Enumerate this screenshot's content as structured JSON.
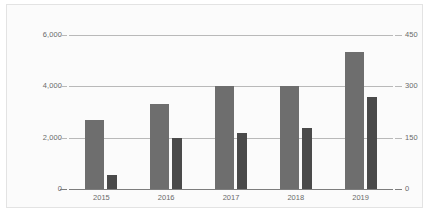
{
  "chart_data": {
    "type": "bar",
    "title": "",
    "subtitle": "",
    "xlabel": "",
    "ylabel": "",
    "categories": [
      "2015",
      "2016",
      "2017",
      "2018",
      "2019"
    ],
    "series": [
      {
        "name": "series-1",
        "axis": "left",
        "color": "#6e6e6e",
        "values": [
          2680,
          3300,
          4020,
          4020,
          5350
        ]
      },
      {
        "name": "series-2",
        "axis": "right",
        "color": "#4a4a4a",
        "values": [
          42,
          150,
          163,
          178,
          268
        ]
      }
    ],
    "left_axis": {
      "ticks": [
        "0",
        "2,000",
        "4,000",
        "6,000"
      ],
      "values": [
        0,
        2000,
        4000,
        6000
      ],
      "ylim": [
        0,
        6000
      ]
    },
    "right_axis": {
      "ticks": [
        "0",
        "150",
        "300",
        "450"
      ],
      "values": [
        0,
        150,
        300,
        450
      ],
      "ylim": [
        0,
        450
      ]
    },
    "grid": true,
    "legend": "none",
    "background_color": "#fbfbfb",
    "border_color": "#e3e3e3",
    "gridline_color": "#b9b9b9",
    "axis_text_color": "#6a6a6a"
  }
}
